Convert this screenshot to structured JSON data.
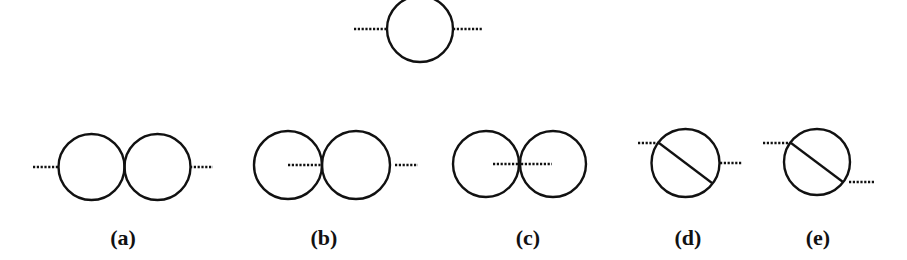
{
  "figure": {
    "top": {
      "name": "one-loop-bubble"
    },
    "panels": [
      {
        "id": "a",
        "label": "(a)",
        "topology": "two bubbles in series, external lines at outer edges"
      },
      {
        "id": "b",
        "label": "(b)",
        "topology": "two tangent bubbles, one external line entering left bubble interior to tangent point"
      },
      {
        "id": "c",
        "label": "(c)",
        "topology": "two tangent bubbles, both external lines interior meeting at tangent point"
      },
      {
        "id": "d",
        "label": "(d)",
        "topology": "bubble with diagonal chord (sunset-like), external lines at upper-left and right"
      },
      {
        "id": "e",
        "label": "(e)",
        "topology": "bubble with diagonal chord, external lines at chord endpoints"
      }
    ],
    "colors": {
      "line": "#111111",
      "background": "#ffffff"
    }
  }
}
